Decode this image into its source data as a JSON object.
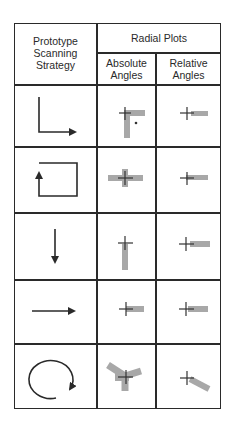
{
  "table": {
    "header": {
      "col1": "Prototype Scanning Strategy",
      "col1_lines": [
        "Prototype",
        "Scanning",
        "Strategy"
      ],
      "group": "Radial Plots",
      "sub1_lines": [
        "Absolute",
        "Angles"
      ],
      "sub2_lines": [
        "Relative",
        "Angles"
      ]
    },
    "rows": [
      {
        "strategy_icon": "l-shape-right-arrow",
        "absolute": "plus-with-right-and-down-arms",
        "relative": "plus-with-right-arm"
      },
      {
        "strategy_icon": "rectangle-loop-up-arrow",
        "absolute": "plus-with-left-and-right-arms",
        "relative": "plus-with-right-arm"
      },
      {
        "strategy_icon": "down-arrow",
        "absolute": "plus-with-down-arm",
        "relative": "plus-with-right-arm"
      },
      {
        "strategy_icon": "right-arrow",
        "absolute": "plus-with-right-arm",
        "relative": "plus-with-right-arm"
      },
      {
        "strategy_icon": "circular-clockwise-arrow",
        "absolute": "plus-with-multiple-arms",
        "relative": "plus-with-diagonal-arm"
      }
    ],
    "colors": {
      "line": "#2a2a2a",
      "plot_bar": "#a8a8a8",
      "plot_cross": "#333333"
    }
  }
}
